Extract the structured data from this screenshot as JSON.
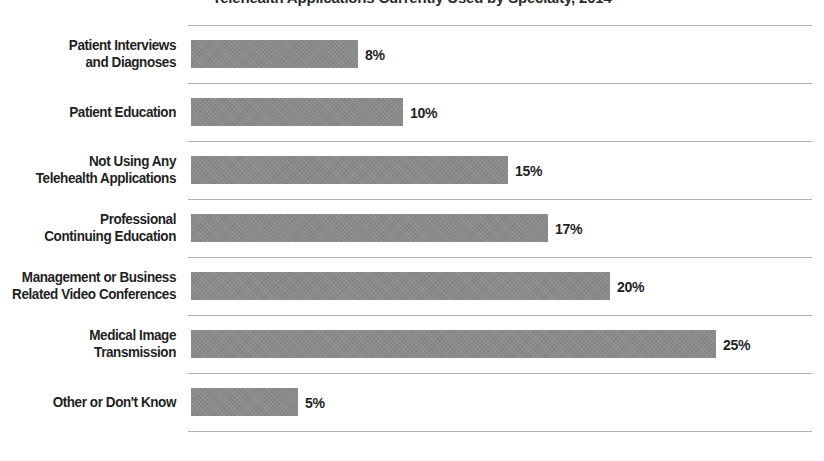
{
  "chart_data": {
    "type": "bar",
    "orientation": "horizontal",
    "title": "Telehealth Applications Currently Used by Specialty, 2014",
    "subtitle": "",
    "xlabel": "",
    "ylabel": "",
    "xlim": [
      0,
      28
    ],
    "grid": true,
    "legend": null,
    "value_suffix": "%",
    "bar_color": "#8a8a8a",
    "gridline_color": "#b3b3b3",
    "label_color": "#1f1f1f",
    "categories": [
      "Patient Interviews and Diagnoses",
      "Patient Education",
      "Not Using Any Telehealth Applications",
      "Professional Continuing Education",
      "Management or Business Related Video Conferences",
      "Medical Image Transmission",
      "Other or Don't Know"
    ],
    "values": [
      8,
      10,
      15,
      17,
      20,
      25,
      5
    ],
    "value_labels": [
      "8%",
      "10%",
      "15%",
      "17%",
      "20%",
      "25%",
      "5%"
    ]
  },
  "rows": [
    {
      "label_lines": [
        "Patient Interviews",
        "and Diagnoses"
      ],
      "value": 8,
      "value_label": "8%",
      "bar_width_px": 167
    },
    {
      "label_lines": [
        "Patient Education"
      ],
      "value": 10,
      "value_label": "10%",
      "bar_width_px": 212
    },
    {
      "label_lines": [
        "Not Using Any",
        "Telehealth Applications"
      ],
      "value": 15,
      "value_label": "15%",
      "bar_width_px": 317
    },
    {
      "label_lines": [
        "Professional",
        "Continuing Education"
      ],
      "value": 17,
      "value_label": "17%",
      "bar_width_px": 357
    },
    {
      "label_lines": [
        "Management or Business",
        "Related Video Conferences"
      ],
      "value": 20,
      "value_label": "20%",
      "bar_width_px": 419
    },
    {
      "label_lines": [
        "Medical Image",
        "Transmission"
      ],
      "value": 25,
      "value_label": "25%",
      "bar_width_px": 525
    },
    {
      "label_lines": [
        "Other or Don't Know"
      ],
      "value": 5,
      "value_label": "5%",
      "bar_width_px": 107
    }
  ]
}
